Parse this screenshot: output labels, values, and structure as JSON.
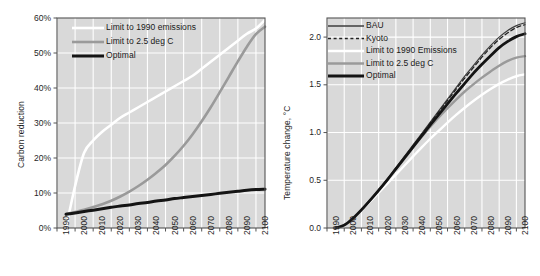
{
  "figure": {
    "background": "#ffffff",
    "panel_background": "#d9d9d9",
    "grid_color": "#ffffff",
    "axis_color": "#545454"
  },
  "colors": {
    "optimal": "#141414",
    "limit_2_5": "#9a9a9a",
    "limit_1990": "#ffffff",
    "bau": "#3d3d3d",
    "kyoto": "#222222"
  },
  "chart_data": [
    {
      "id": "carbon-reduction",
      "type": "line",
      "title": "",
      "xlabel": "",
      "ylabel": "Carbon reduction",
      "xlim": [
        1990,
        2105
      ],
      "ylim": [
        0,
        60
      ],
      "grid": true,
      "legend_position": "top-left",
      "xticks": [
        "1990",
        "2000",
        "2010",
        "2020",
        "2030",
        "2040",
        "2050",
        "2060",
        "2070",
        "2080",
        "2090",
        "2100"
      ],
      "yticks": [
        "0%",
        "10%",
        "20%",
        "30%",
        "40%",
        "50%",
        "60%"
      ],
      "ytick_values": [
        0,
        10,
        20,
        30,
        40,
        50,
        60
      ],
      "x": [
        1995,
        2000,
        2005,
        2010,
        2015,
        2020,
        2025,
        2030,
        2035,
        2040,
        2045,
        2050,
        2055,
        2060,
        2065,
        2070,
        2075,
        2080,
        2085,
        2090,
        2095,
        2100,
        2105
      ],
      "series": [
        {
          "name": "Limit to 1990 emissions",
          "color": "#ffffff",
          "width": 2.6,
          "dash": "none",
          "values": [
            0,
            12,
            21.5,
            25,
            27.5,
            29.5,
            31.5,
            33,
            34.5,
            36,
            37.5,
            39,
            40.5,
            42,
            43.5,
            45.5,
            47.5,
            49.5,
            51.5,
            53.5,
            55.5,
            57,
            59.5
          ]
        },
        {
          "name": "Limit to 2.5 deg C",
          "color": "#9a9a9a",
          "width": 2.6,
          "dash": "none",
          "values": [
            4,
            4.6,
            5.2,
            6,
            6.8,
            7.8,
            9,
            10.4,
            12,
            13.8,
            15.8,
            18,
            20.6,
            23.5,
            26.8,
            30.5,
            34.5,
            38.8,
            43.2,
            47.6,
            51.8,
            55.4,
            57.5
          ]
        },
        {
          "name": "Optimal",
          "color": "#141414",
          "width": 3.0,
          "dash": "none",
          "values": [
            3.9,
            4.3,
            4.7,
            5.1,
            5.5,
            5.9,
            6.3,
            6.6,
            7.0,
            7.3,
            7.7,
            8.0,
            8.4,
            8.7,
            9.0,
            9.3,
            9.6,
            9.9,
            10.2,
            10.5,
            10.8,
            11.0,
            11.1
          ]
        }
      ]
    },
    {
      "id": "temperature-change",
      "type": "line",
      "title": "",
      "xlabel": "",
      "ylabel": "Temperature change, °C",
      "xlim": [
        1990,
        2105
      ],
      "ylim": [
        0,
        2.2
      ],
      "grid": true,
      "legend_position": "top-left",
      "xticks": [
        "1990",
        "2000",
        "2010",
        "2020",
        "2030",
        "2040",
        "2050",
        "2060",
        "2070",
        "2080",
        "2090",
        "2100"
      ],
      "yticks": [
        "0.0",
        "0.5",
        "1.0",
        "1.5",
        "2.0"
      ],
      "ytick_values": [
        0.0,
        0.5,
        1.0,
        1.5,
        2.0
      ],
      "x": [
        1995,
        2000,
        2005,
        2010,
        2015,
        2020,
        2025,
        2030,
        2035,
        2040,
        2045,
        2050,
        2055,
        2060,
        2065,
        2070,
        2075,
        2080,
        2085,
        2090,
        2095,
        2100,
        2105
      ],
      "series": [
        {
          "name": "BAU",
          "color": "#3d3d3d",
          "width": 1.2,
          "dash": "none",
          "values": [
            0.0,
            0.03,
            0.1,
            0.19,
            0.29,
            0.4,
            0.51,
            0.63,
            0.75,
            0.87,
            0.99,
            1.11,
            1.23,
            1.35,
            1.47,
            1.59,
            1.7,
            1.81,
            1.91,
            2.0,
            2.07,
            2.12,
            2.15
          ]
        },
        {
          "name": "Kyoto",
          "color": "#222222",
          "width": 1.3,
          "dash": "4,3",
          "values": [
            0.0,
            0.03,
            0.1,
            0.19,
            0.29,
            0.395,
            0.505,
            0.62,
            0.74,
            0.86,
            0.98,
            1.1,
            1.22,
            1.335,
            1.455,
            1.57,
            1.68,
            1.79,
            1.89,
            1.975,
            2.045,
            2.1,
            2.13
          ]
        },
        {
          "name": "Limit to 1990 Emissions",
          "color": "#ffffff",
          "width": 2.4,
          "dash": "none",
          "values": [
            0.0,
            0.03,
            0.1,
            0.185,
            0.275,
            0.37,
            0.465,
            0.56,
            0.655,
            0.75,
            0.845,
            0.935,
            1.02,
            1.105,
            1.185,
            1.26,
            1.33,
            1.395,
            1.455,
            1.51,
            1.555,
            1.59,
            1.61
          ]
        },
        {
          "name": "Limit to 2.5 deg C",
          "color": "#9a9a9a",
          "width": 2.4,
          "dash": "none",
          "values": [
            0.0,
            0.03,
            0.1,
            0.19,
            0.29,
            0.395,
            0.5,
            0.615,
            0.73,
            0.845,
            0.955,
            1.06,
            1.16,
            1.255,
            1.345,
            1.43,
            1.505,
            1.575,
            1.64,
            1.7,
            1.75,
            1.785,
            1.8
          ]
        },
        {
          "name": "Optimal",
          "color": "#141414",
          "width": 2.8,
          "dash": "none",
          "values": [
            0.0,
            0.03,
            0.1,
            0.19,
            0.29,
            0.395,
            0.505,
            0.62,
            0.735,
            0.85,
            0.965,
            1.08,
            1.19,
            1.3,
            1.41,
            1.515,
            1.62,
            1.715,
            1.805,
            1.89,
            1.955,
            2.005,
            2.035
          ]
        }
      ]
    }
  ]
}
